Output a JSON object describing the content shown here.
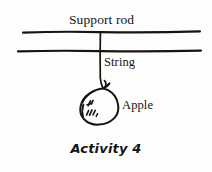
{
  "figure": {
    "caption": "Activity 4",
    "background_color": "#fdfdfc",
    "ink_color": "#151515",
    "labels": {
      "support_rod": "Support rod",
      "string": "String",
      "apple": "Apple"
    },
    "parts": [
      {
        "name": "support-rod",
        "label": "Support rod",
        "type": "horizontal-bar"
      },
      {
        "name": "string",
        "label": "String",
        "type": "vertical-line"
      },
      {
        "name": "apple",
        "label": "Apple",
        "type": "hanging-mass"
      }
    ]
  }
}
